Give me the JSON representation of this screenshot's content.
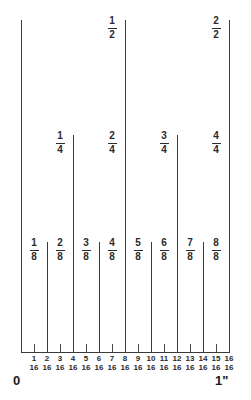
{
  "diagram": {
    "geometry": {
      "left_x": 21,
      "right_x": 229,
      "baseline_y": 352,
      "divisions": 16,
      "step_px": 13
    },
    "endpoints": {
      "start_label": "0",
      "end_label": "1\""
    },
    "colors": {
      "line": "#3a3a3a",
      "text": "#2b2b2b",
      "background": "#ffffff"
    }
  },
  "halves": [
    {
      "index": 8,
      "numerator": "1",
      "denominator": "2",
      "top_y": 20
    },
    {
      "index": 16,
      "numerator": "2",
      "denominator": "2",
      "top_y": 20
    }
  ],
  "whole_lines": [
    {
      "index": 0,
      "top_y": 20
    }
  ],
  "quarters": [
    {
      "index": 4,
      "numerator": "1",
      "denominator": "4",
      "top_y": 135
    },
    {
      "index": 8,
      "numerator": "2",
      "denominator": "4",
      "top_y": 135
    },
    {
      "index": 12,
      "numerator": "3",
      "denominator": "4",
      "top_y": 135
    },
    {
      "index": 16,
      "numerator": "4",
      "denominator": "4",
      "top_y": 135
    }
  ],
  "eighths": [
    {
      "index": 2,
      "numerator": "1",
      "denominator": "8",
      "top_y": 242
    },
    {
      "index": 4,
      "numerator": "2",
      "denominator": "8",
      "top_y": 242
    },
    {
      "index": 6,
      "numerator": "3",
      "denominator": "8",
      "top_y": 242
    },
    {
      "index": 8,
      "numerator": "4",
      "denominator": "8",
      "top_y": 242
    },
    {
      "index": 10,
      "numerator": "5",
      "denominator": "8",
      "top_y": 242
    },
    {
      "index": 12,
      "numerator": "6",
      "denominator": "8",
      "top_y": 242
    },
    {
      "index": 14,
      "numerator": "7",
      "denominator": "8",
      "top_y": 242
    },
    {
      "index": 16,
      "numerator": "8",
      "denominator": "8",
      "top_y": 242
    }
  ],
  "sixteenth_ticks": [
    {
      "index": 1
    },
    {
      "index": 3
    },
    {
      "index": 5
    },
    {
      "index": 7
    },
    {
      "index": 9
    },
    {
      "index": 11
    },
    {
      "index": 13
    },
    {
      "index": 15
    }
  ],
  "sixteenth_labels": [
    {
      "index": 1,
      "numerator": "1",
      "denominator": "16"
    },
    {
      "index": 2,
      "numerator": "2",
      "denominator": "16"
    },
    {
      "index": 3,
      "numerator": "3",
      "denominator": "16"
    },
    {
      "index": 4,
      "numerator": "4",
      "denominator": "16"
    },
    {
      "index": 5,
      "numerator": "5",
      "denominator": "16"
    },
    {
      "index": 6,
      "numerator": "6",
      "denominator": "16"
    },
    {
      "index": 7,
      "numerator": "7",
      "denominator": "16"
    },
    {
      "index": 8,
      "numerator": "8",
      "denominator": "16"
    },
    {
      "index": 9,
      "numerator": "9",
      "denominator": "16"
    },
    {
      "index": 10,
      "numerator": "10",
      "denominator": "16"
    },
    {
      "index": 11,
      "numerator": "11",
      "denominator": "16"
    },
    {
      "index": 12,
      "numerator": "12",
      "denominator": "16"
    },
    {
      "index": 13,
      "numerator": "13",
      "denominator": "16"
    },
    {
      "index": 14,
      "numerator": "14",
      "denominator": "16"
    },
    {
      "index": 15,
      "numerator": "15",
      "denominator": "16"
    },
    {
      "index": 16,
      "numerator": "16",
      "denominator": "16"
    }
  ]
}
